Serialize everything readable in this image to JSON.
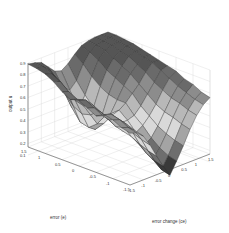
{
  "chart_data": {
    "type": "surface",
    "title": "",
    "xlabel": "error (e)",
    "ylabel": "error change (ce)",
    "zlabel": "output u",
    "x_ticks": [
      "-1.5",
      "-1",
      "-0.5",
      "0",
      "0.5",
      "1",
      "1.5"
    ],
    "y_ticks": [
      "-1.5",
      "-1",
      "-0.5",
      "0",
      "0.5",
      "1",
      "1.5"
    ],
    "z_ticks": [
      "0.1",
      "0.2",
      "0.3",
      "0.4",
      "0.5",
      "0.6",
      "0.7",
      "0.8",
      "0.9"
    ],
    "xlim": [
      -1.5,
      1.5
    ],
    "ylim": [
      -1.5,
      1.5
    ],
    "zlim": [
      0.1,
      0.9
    ],
    "grid": true,
    "colormap": "gray",
    "x": [
      -1.5,
      -1.25,
      -1.0,
      -0.75,
      -0.5,
      -0.25,
      0.0,
      0.25,
      0.5,
      0.75,
      1.0,
      1.25,
      1.5
    ],
    "y": [
      -1.5,
      -1.25,
      -1.0,
      -0.75,
      -0.5,
      -0.25,
      0.0,
      0.25,
      0.5,
      0.75,
      1.0,
      1.25,
      1.5
    ],
    "z": [
      [
        0.62,
        0.6,
        0.55,
        0.45,
        0.33,
        0.22,
        0.12,
        0.22,
        0.33,
        0.45,
        0.55,
        0.62,
        0.66
      ],
      [
        0.64,
        0.62,
        0.57,
        0.47,
        0.35,
        0.24,
        0.14,
        0.24,
        0.35,
        0.47,
        0.57,
        0.64,
        0.68
      ],
      [
        0.68,
        0.66,
        0.6,
        0.5,
        0.38,
        0.28,
        0.2,
        0.28,
        0.38,
        0.5,
        0.6,
        0.67,
        0.72
      ],
      [
        0.7,
        0.68,
        0.62,
        0.52,
        0.42,
        0.34,
        0.3,
        0.34,
        0.42,
        0.52,
        0.62,
        0.7,
        0.74
      ],
      [
        0.66,
        0.64,
        0.58,
        0.5,
        0.44,
        0.4,
        0.38,
        0.42,
        0.48,
        0.56,
        0.66,
        0.74,
        0.78
      ],
      [
        0.7,
        0.68,
        0.62,
        0.54,
        0.48,
        0.46,
        0.46,
        0.48,
        0.54,
        0.62,
        0.7,
        0.78,
        0.8
      ],
      [
        0.74,
        0.72,
        0.66,
        0.58,
        0.52,
        0.5,
        0.52,
        0.56,
        0.62,
        0.68,
        0.76,
        0.82,
        0.82
      ],
      [
        0.72,
        0.7,
        0.62,
        0.52,
        0.42,
        0.4,
        0.46,
        0.56,
        0.66,
        0.74,
        0.8,
        0.84,
        0.84
      ],
      [
        0.76,
        0.74,
        0.64,
        0.5,
        0.36,
        0.32,
        0.42,
        0.58,
        0.7,
        0.78,
        0.84,
        0.86,
        0.86
      ],
      [
        0.82,
        0.8,
        0.7,
        0.54,
        0.38,
        0.34,
        0.46,
        0.62,
        0.74,
        0.82,
        0.86,
        0.88,
        0.88
      ],
      [
        0.86,
        0.84,
        0.76,
        0.62,
        0.48,
        0.44,
        0.54,
        0.68,
        0.8,
        0.86,
        0.88,
        0.89,
        0.89
      ],
      [
        0.88,
        0.87,
        0.82,
        0.72,
        0.62,
        0.58,
        0.64,
        0.76,
        0.84,
        0.88,
        0.89,
        0.9,
        0.9
      ],
      [
        0.89,
        0.88,
        0.86,
        0.8,
        0.74,
        0.72,
        0.76,
        0.82,
        0.87,
        0.89,
        0.9,
        0.9,
        0.9
      ]
    ],
    "z_note": "z[i][j] = output at e = x[i], ce = y[j]; values estimated visually",
    "view": {
      "front_corner": [
        130,
        201
      ],
      "left_corner": [
        28,
        163
      ],
      "right_corner": [
        210,
        170
      ],
      "z_base_y_at_0_1": 155,
      "z_px_per_unit": 115
    }
  }
}
